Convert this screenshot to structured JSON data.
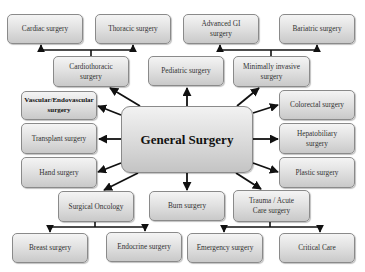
{
  "diagram": {
    "center": "General Surgery",
    "nodes": {
      "cardiac": "Cardiac surgery",
      "thoracic": "Thoracic surgery",
      "advanced_gi": "Advanced GI surgery",
      "bariatric": "Bariatric surgery",
      "cardiothoracic": "Cardiothoracic surgery",
      "pediatric": "Pediatric surgery",
      "minimally_invasive": "Minimally invasive surgery",
      "vascular": "Vascular/Endovascular surgery",
      "transplant": "Transplant surgery",
      "hand": "Hand surgery",
      "colorectal": "Colorectal surgery",
      "hepatobiliary": "Hepatobiliary surgery",
      "plastic": "Plastic surgery",
      "surgical_oncology": "Surgical Oncology",
      "burn": "Burn surgery",
      "trauma": "Trauma / Acute Care surgery",
      "breast": "Breast surgery",
      "endocrine": "Endocrine surgery",
      "emergency": "Emergency surgery",
      "critical_care": "Critical Care"
    },
    "edges_from_center": [
      "cardiothoracic",
      "pediatric",
      "minimally_invasive",
      "vascular",
      "transplant",
      "hand",
      "colorectal",
      "hepatobiliary",
      "plastic",
      "surgical_oncology",
      "burn",
      "trauma"
    ],
    "sub_branches": {
      "cardiothoracic": [
        "cardiac",
        "thoracic"
      ],
      "minimally_invasive": [
        "advanced_gi",
        "bariatric"
      ],
      "surgical_oncology": [
        "breast",
        "endocrine"
      ],
      "trauma": [
        "emergency",
        "critical_care"
      ]
    }
  }
}
